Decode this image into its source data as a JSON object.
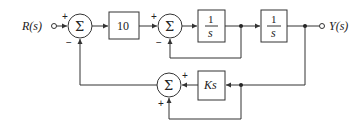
{
  "diagram": {
    "type": "control-system-block-diagram",
    "input_label": "R(s)",
    "output_label": "Y(s)",
    "summing_symbol": "Σ",
    "blocks": [
      {
        "id": "gain",
        "label": "10"
      },
      {
        "id": "integrator1",
        "numerator": "1",
        "denominator": "s"
      },
      {
        "id": "integrator2",
        "numerator": "1",
        "denominator": "s"
      },
      {
        "id": "derivative",
        "label": "Ks"
      }
    ],
    "summing_junctions": [
      {
        "id": "sum1",
        "signs": {
          "top_left": "+",
          "bottom_left": "−"
        }
      },
      {
        "id": "sum2",
        "signs": {
          "top_left": "+",
          "bottom_left": "−"
        }
      },
      {
        "id": "sum3",
        "signs": {
          "top_right": "+",
          "bottom_left": "+"
        }
      }
    ]
  }
}
